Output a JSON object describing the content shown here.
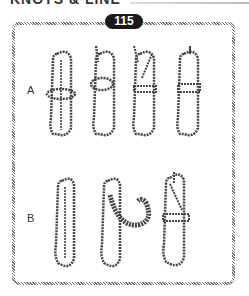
{
  "heading": {
    "text": "KNOTS & LINE"
  },
  "badge": {
    "number": "115"
  },
  "rows": [
    {
      "label": "A",
      "figures": 4
    },
    {
      "label": "B",
      "figures": 3
    }
  ]
}
